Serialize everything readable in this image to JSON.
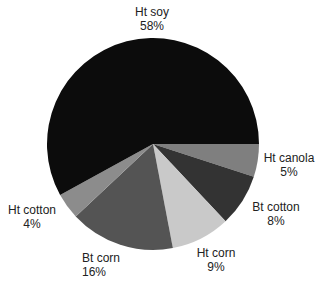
{
  "chart_data": {
    "type": "pie",
    "title": "",
    "categories": [
      "Ht canola",
      "Bt cotton",
      "Ht corn",
      "Bt corn",
      "Ht cotton",
      "Ht soy"
    ],
    "values": [
      5,
      8,
      9,
      16,
      4,
      58
    ],
    "value_format": "percent",
    "start_angle_deg_clockwise_from_top": 90,
    "direction": "clockwise",
    "colors": [
      "#7f7f7f",
      "#333333",
      "#c9c9c9",
      "#545454",
      "#8c8c8c",
      "#0c0c0c"
    ],
    "labels": [
      {
        "name": "Ht canola",
        "pct": "5%",
        "x": 289,
        "y": 158,
        "anchor": "middle"
      },
      {
        "name": "Bt cotton",
        "pct": "8%",
        "x": 276,
        "y": 207,
        "anchor": "middle"
      },
      {
        "name": "Ht corn",
        "pct": "9%",
        "x": 216,
        "y": 253,
        "anchor": "middle"
      },
      {
        "name": "Bt corn",
        "pct": "16%",
        "x": 82,
        "y": 258,
        "anchor": "start"
      },
      {
        "name": "Ht cotton",
        "pct": "4%",
        "x": 32,
        "y": 210,
        "anchor": "middle"
      },
      {
        "name": "Ht soy",
        "pct": "58%",
        "x": 152,
        "y": 12,
        "anchor": "middle"
      }
    ],
    "legend": "none",
    "geometry": {
      "cx": 153,
      "cy": 144,
      "r": 106
    }
  }
}
